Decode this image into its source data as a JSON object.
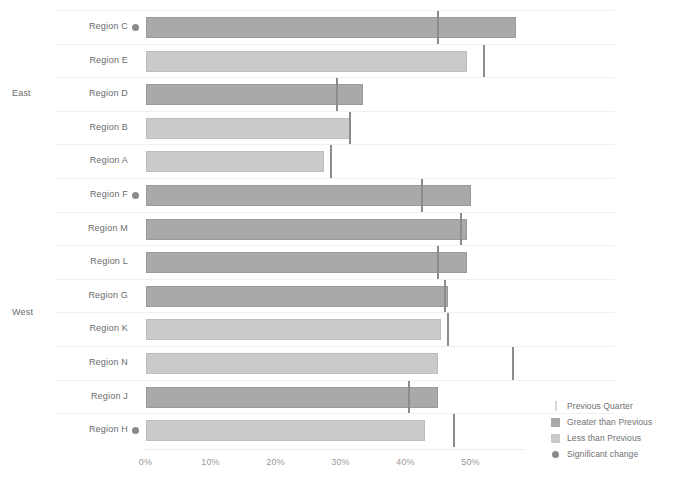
{
  "chart_data": {
    "type": "bar",
    "title": "",
    "subtitle": "",
    "xlabel": "",
    "ylabel": "",
    "orientation": "horizontal",
    "xlim": [
      0,
      55
    ],
    "grid": false,
    "tick_labels": [
      "0%",
      "10%",
      "20%",
      "30%",
      "40%",
      "50%"
    ],
    "tick_values": [
      0,
      10,
      20,
      30,
      40,
      50
    ],
    "legend_position": "bottom-right",
    "groups": [
      {
        "name": "East",
        "label": "East"
      },
      {
        "name": "West",
        "label": "West"
      }
    ],
    "categories": [
      "Region C",
      "Region E",
      "Region D",
      "Region B",
      "Region A",
      "Region F",
      "Region M",
      "Region L",
      "Region G",
      "Region K",
      "Region N",
      "Region J",
      "Region H"
    ],
    "series": [
      {
        "name": "Current Quarter",
        "values": [
          57.0,
          49.5,
          33.5,
          31.5,
          27.5,
          50.0,
          49.5,
          49.5,
          46.5,
          45.5,
          45.0,
          45.0,
          43.0
        ]
      },
      {
        "name": "Previous Quarter",
        "values": [
          45.0,
          52.0,
          29.5,
          31.5,
          28.5,
          42.5,
          48.5,
          45.0,
          46.0,
          46.5,
          56.5,
          40.5,
          47.5
        ]
      }
    ],
    "rows": [
      {
        "category": "Region C",
        "group": "East",
        "value": 57.0,
        "previous": 45.0,
        "direction": "greater",
        "significant": true
      },
      {
        "category": "Region E",
        "group": "East",
        "value": 49.5,
        "previous": 52.0,
        "direction": "less",
        "significant": false
      },
      {
        "category": "Region D",
        "group": "East",
        "value": 33.5,
        "previous": 29.5,
        "direction": "greater",
        "significant": false
      },
      {
        "category": "Region B",
        "group": "East",
        "value": 31.5,
        "previous": 31.5,
        "direction": "less",
        "significant": false
      },
      {
        "category": "Region A",
        "group": "East",
        "value": 27.5,
        "previous": 28.5,
        "direction": "less",
        "significant": false
      },
      {
        "category": "Region F",
        "group": "West",
        "value": 50.0,
        "previous": 42.5,
        "direction": "greater",
        "significant": true
      },
      {
        "category": "Region M",
        "group": "West",
        "value": 49.5,
        "previous": 48.5,
        "direction": "greater",
        "significant": false
      },
      {
        "category": "Region L",
        "group": "West",
        "value": 49.5,
        "previous": 45.0,
        "direction": "greater",
        "significant": false
      },
      {
        "category": "Region G",
        "group": "West",
        "value": 46.5,
        "previous": 46.0,
        "direction": "greater",
        "significant": false
      },
      {
        "category": "Region K",
        "group": "West",
        "value": 45.5,
        "previous": 46.5,
        "direction": "less",
        "significant": false
      },
      {
        "category": "Region N",
        "group": "West",
        "value": 45.0,
        "previous": 56.5,
        "direction": "less",
        "significant": false
      },
      {
        "category": "Region J",
        "group": "West",
        "value": 45.0,
        "previous": 40.5,
        "direction": "greater",
        "significant": false
      },
      {
        "category": "Region H",
        "group": "West",
        "value": 43.0,
        "previous": 47.5,
        "direction": "less",
        "significant": true
      }
    ],
    "legend": [
      {
        "marker": "line",
        "label": "Previous Quarter"
      },
      {
        "marker": "box-dark",
        "label": "Greater than Previous"
      },
      {
        "marker": "box-light",
        "label": "Less than Previous"
      },
      {
        "marker": "dot",
        "label": "Significant change"
      }
    ],
    "colors": {
      "greater": "#a9a9a9",
      "less": "#cacaca",
      "reference": "#8c8c8c",
      "dot": "#8a8a8a",
      "text": "#6b6b6b",
      "axis_text": "#9a9a9a",
      "background": "#ffffff"
    }
  }
}
